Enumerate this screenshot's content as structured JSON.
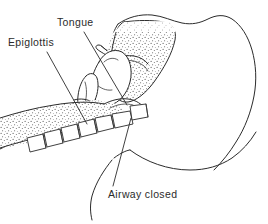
{
  "figure": {
    "width": 268,
    "height": 224,
    "background_color": "#ffffff",
    "line_color": "#2b2b2b",
    "style": "line-art medical illustration with stipple shading"
  },
  "labels": {
    "tongue": {
      "text": "Tongue",
      "x": 57,
      "y": 26
    },
    "epiglottis": {
      "text": "Epiglottis",
      "x": 8,
      "y": 46
    },
    "airway_closed": {
      "text": "Airway closed",
      "x": 108,
      "y": 198
    }
  },
  "anatomy": {
    "parts": [
      "head-outline",
      "nasal-cavity",
      "soft-palate",
      "tongue",
      "epiglottis",
      "larynx",
      "cervical-vertebrae",
      "mandible",
      "neck-contour"
    ],
    "vertebrae_count": 6,
    "shading": "stipple"
  }
}
